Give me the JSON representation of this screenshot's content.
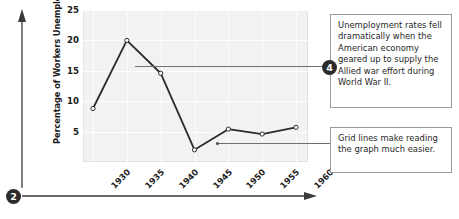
{
  "chart_data": {
    "type": "line",
    "title": "",
    "xlabel": "",
    "ylabel": "Percentage of Workers Unemployed",
    "categories": [
      "1930",
      "1935",
      "1940",
      "1945",
      "1950",
      "1955",
      "1960"
    ],
    "x": [
      1930,
      1935,
      1940,
      1945,
      1950,
      1955,
      1960
    ],
    "values": [
      8.8,
      20.0,
      14.6,
      2.0,
      5.4,
      4.6,
      5.7
    ],
    "series": [
      {
        "name": "Percentage of Workers Unemployed",
        "values": [
          8.8,
          20.0,
          14.6,
          2.0,
          5.4,
          4.6,
          5.7
        ]
      }
    ],
    "ylim": [
      0,
      25
    ],
    "yticks": [
      5,
      10,
      15,
      20,
      25
    ],
    "ytick_labels": [
      "5",
      "10",
      "15",
      "20",
      "25"
    ],
    "xtick_labels": [
      "1930",
      "1935",
      "1940",
      "1945",
      "1950",
      "1955",
      "1960"
    ],
    "grid": true,
    "legend": false,
    "legend_position": "none",
    "marker": "open-circle",
    "line_color": "#2b2b2b",
    "plot_background": "#f2f2f2",
    "gridline_color": "#fdfdfd"
  },
  "axes": {
    "y_title": "Percentage of Workers Unemployed",
    "y_arrow_name": "y-axis-arrow",
    "x_arrow_name": "x-axis-arrow"
  },
  "callouts": [
    {
      "badge": "4",
      "text": "Unemployment rates fell dramatically when the American economy geared up to supply the Allied war effort during World War II."
    },
    {
      "badge": "",
      "text": "Grid lines make reading the graph much easier."
    }
  ],
  "badges": {
    "chart_badge": "2",
    "callout_badge": "4"
  },
  "colors": {
    "accent": "#2b2b2b",
    "plot_bg": "#f2f2f2",
    "grid": "#fdfdfd",
    "callout_border": "#9b9b9b",
    "leader": "#6f6f6f"
  }
}
